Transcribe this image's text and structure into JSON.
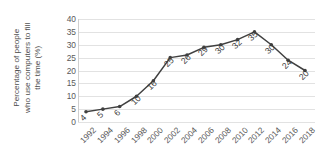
{
  "chart_data": {
    "type": "line",
    "title": "",
    "xlabel": "",
    "ylabel": "Percentage of people who use computers to fill the time (%)",
    "ylabel_lines": [
      "Percentage of people",
      "who use computers to fill",
      "the time (%)"
    ],
    "categories": [
      "1992",
      "1994",
      "1996",
      "1998",
      "2000",
      "2002",
      "2004",
      "2006",
      "2008",
      "2010",
      "2012",
      "2014",
      "2016",
      "2018"
    ],
    "values": [
      4,
      5,
      6,
      10,
      16,
      25,
      26,
      29,
      30,
      32,
      35,
      30,
      24,
      20
    ],
    "point_labels": [
      "4",
      "5",
      "6",
      "10",
      "16",
      "25",
      "26",
      "29",
      "30",
      "32",
      "35",
      "30",
      "24",
      "20"
    ],
    "ylim": [
      0,
      40
    ],
    "ytick_labels": [
      "0",
      "5",
      "10",
      "15",
      "20",
      "25",
      "30",
      "35",
      "40"
    ],
    "ytick_values": [
      0,
      5,
      10,
      15,
      20,
      25,
      30,
      35,
      40
    ],
    "grid": true,
    "legend": false,
    "legend_position": "none",
    "series": [
      {
        "name": "Percentage of people who use computers to fill the time (%)",
        "values": [
          4,
          5,
          6,
          10,
          16,
          25,
          26,
          29,
          30,
          32,
          35,
          30,
          24,
          20
        ]
      }
    ],
    "colors": {
      "line": "#404040",
      "marker": "#404040",
      "gridline": "#e2e2e2",
      "axis": "#cfcfcf",
      "tick_text": "#595959",
      "label_text": "#3a3a3a",
      "background": "#ffffff"
    }
  }
}
